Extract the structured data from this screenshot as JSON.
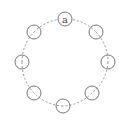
{
  "diagram": {
    "type": "ring",
    "center": {
      "x": 65,
      "y": 62
    },
    "ring_radius": 43,
    "node_radius": 7,
    "edge_style": "dashed",
    "colors": {
      "stroke": "#777777",
      "edge": "#8a8a8a",
      "background": "#ffffff",
      "label": "#444444"
    },
    "nodes": [
      {
        "id": "n0",
        "label": "a",
        "x": 65,
        "y": 19
      },
      {
        "id": "n1",
        "label": "",
        "x": 96,
        "y": 32
      },
      {
        "id": "n2",
        "label": "",
        "x": 108,
        "y": 62
      },
      {
        "id": "n3",
        "label": "",
        "x": 92,
        "y": 93
      },
      {
        "id": "n4",
        "label": "",
        "x": 63,
        "y": 106
      },
      {
        "id": "n5",
        "label": "",
        "x": 34,
        "y": 93
      },
      {
        "id": "n6",
        "label": "",
        "x": 22,
        "y": 62
      },
      {
        "id": "n7",
        "label": "",
        "x": 34,
        "y": 32
      }
    ]
  }
}
